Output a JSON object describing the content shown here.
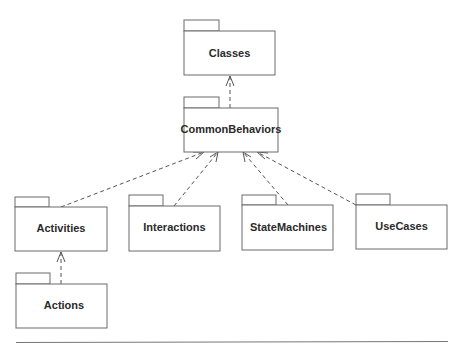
{
  "diagram": {
    "type": "UML package diagram",
    "packages": [
      {
        "id": "classes",
        "label": "Classes",
        "x": 184,
        "y": 31,
        "w": 91,
        "h": 44
      },
      {
        "id": "common-behaviors",
        "label": "CommonBehaviors",
        "x": 184,
        "y": 108,
        "w": 94,
        "h": 44
      },
      {
        "id": "activities",
        "label": "Activities",
        "x": 15,
        "y": 207,
        "w": 92,
        "h": 44
      },
      {
        "id": "interactions",
        "label": "Interactions",
        "x": 129,
        "y": 206,
        "w": 91,
        "h": 45
      },
      {
        "id": "state-machines",
        "label": "StateMachines",
        "x": 242,
        "y": 205,
        "w": 91,
        "h": 45
      },
      {
        "id": "use-cases",
        "label": "UseCases",
        "x": 356,
        "y": 205,
        "w": 91,
        "h": 44
      },
      {
        "id": "actions",
        "label": "Actions",
        "x": 16,
        "y": 284,
        "w": 91,
        "h": 44
      }
    ],
    "dependencies": [
      {
        "from": "common-behaviors",
        "to": "classes"
      },
      {
        "from": "activities",
        "to": "common-behaviors"
      },
      {
        "from": "interactions",
        "to": "common-behaviors"
      },
      {
        "from": "state-machines",
        "to": "common-behaviors"
      },
      {
        "from": "use-cases",
        "to": "common-behaviors"
      },
      {
        "from": "actions",
        "to": "activities"
      }
    ],
    "colors": {
      "stroke": "#6a6a6a",
      "text": "#2a2a2a",
      "background": "#ffffff"
    }
  },
  "labels": {
    "classes": "Classes",
    "common_behaviors": "CommonBehaviors",
    "activities": "Activities",
    "interactions": "Interactions",
    "state_machines": "StateMachines",
    "use_cases": "UseCases",
    "actions": "Actions"
  }
}
